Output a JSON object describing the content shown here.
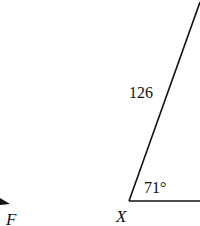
{
  "diagram": {
    "vertices": {
      "X": {
        "label": "X"
      },
      "F": {
        "label": "F"
      }
    },
    "side_label": "126",
    "angle_label": "71°",
    "stroke_color": "#111111",
    "background": "#ffffff"
  }
}
